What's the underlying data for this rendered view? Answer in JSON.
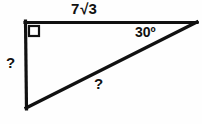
{
  "figure": {
    "background_color": "#fefefe",
    "stroke_color": "#111111",
    "stroke_width": 3
  },
  "labels": {
    "top_side": {
      "coefficient": "7",
      "radical_symbol": "√",
      "radicand": "3",
      "full_text": "7√3"
    },
    "angle": "30º",
    "left_side": "?",
    "hypotenuse": "?"
  },
  "geometry": {
    "vertices": {
      "top_left": {
        "x": 25,
        "y": 22
      },
      "top_right": {
        "x": 196,
        "y": 22
      },
      "bottom_left": {
        "x": 26,
        "y": 108
      }
    },
    "right_angle_marker": {
      "at": "top_left",
      "size": 11
    }
  }
}
